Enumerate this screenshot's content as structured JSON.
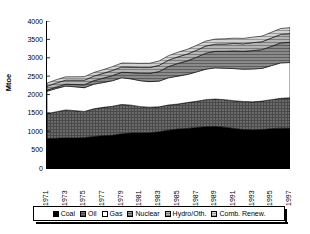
{
  "chart_data": {
    "type": "area",
    "stacked": true,
    "title": "",
    "xlabel": "",
    "ylabel": "Mtoe",
    "ylim": [
      0,
      4000
    ],
    "ytick_step": 500,
    "yticks": [
      4000,
      3500,
      3000,
      2500,
      2000,
      1500,
      1000,
      500,
      0
    ],
    "grid": false,
    "legend_position": "bottom",
    "x": [
      1971,
      1972,
      1973,
      1974,
      1975,
      1976,
      1977,
      1978,
      1979,
      1980,
      1981,
      1982,
      1983,
      1984,
      1985,
      1986,
      1987,
      1988,
      1989,
      1990,
      1991,
      1992,
      1993,
      1994,
      1995,
      1996,
      1997
    ],
    "xtick_labels": [
      "1971",
      "1972",
      "1973",
      "1974",
      "1975",
      "1976",
      "1977",
      "1978",
      "1979",
      "1980",
      "1981",
      "1982",
      "1983",
      "1984",
      "1985",
      "1986",
      "1987",
      "1988",
      "1989",
      "1990",
      "1991",
      "1992",
      "1993",
      "1994",
      "1995",
      "1996",
      "1997"
    ],
    "xtick_labels_shown": [
      "1971",
      "1973",
      "1975",
      "1977",
      "1979",
      "1981",
      "1983",
      "1985",
      "1987",
      "1989",
      "1991",
      "1993",
      "1995",
      "1997"
    ],
    "series": [
      {
        "name": "Coal",
        "color": "#000000",
        "values": [
          800,
          810,
          820,
          820,
          825,
          855,
          880,
          890,
          930,
          950,
          950,
          960,
          985,
          1030,
          1060,
          1075,
          1100,
          1125,
          1130,
          1110,
          1075,
          1045,
          1040,
          1045,
          1070,
          1085,
          1080
        ]
      },
      {
        "name": "Oil",
        "color": "#5a5a5a",
        "values": [
          680,
          720,
          760,
          740,
          715,
          755,
          770,
          790,
          800,
          760,
          720,
          695,
          680,
          685,
          680,
          705,
          715,
          735,
          745,
          750,
          755,
          765,
          760,
          775,
          790,
          810,
          830
        ]
      },
      {
        "name": "Gas",
        "color": "#ffffff",
        "values": [
          610,
          635,
          650,
          650,
          645,
          670,
          675,
          695,
          725,
          715,
          705,
          695,
          700,
          740,
          760,
          765,
          800,
          830,
          850,
          855,
          875,
          880,
          895,
          890,
          925,
          965,
          960
        ]
      },
      {
        "name": "Nuclear",
        "color": "#6e6e6e",
        "values": [
          30,
          40,
          50,
          60,
          80,
          95,
          120,
          140,
          150,
          170,
          205,
          225,
          260,
          305,
          345,
          370,
          400,
          435,
          450,
          460,
          480,
          485,
          500,
          510,
          525,
          545,
          550
        ]
      },
      {
        "name": "Hydro/Oth.",
        "color": "#9e9e9e",
        "values": [
          105,
          110,
          110,
          120,
          125,
          125,
          130,
          140,
          145,
          150,
          155,
          160,
          170,
          175,
          180,
          185,
          190,
          195,
          195,
          200,
          205,
          205,
          215,
          215,
          225,
          230,
          235
        ]
      },
      {
        "name": "Comb. Renew.",
        "color": "#c8c8c8",
        "values": [
          85,
          88,
          90,
          92,
          95,
          98,
          100,
          103,
          106,
          108,
          112,
          115,
          118,
          122,
          125,
          128,
          132,
          135,
          138,
          140,
          143,
          146,
          150,
          153,
          157,
          160,
          164
        ]
      }
    ]
  },
  "legend": {
    "items": [
      {
        "label": "Coal",
        "color": "#000000"
      },
      {
        "label": "Oil",
        "color": "#5a5a5a"
      },
      {
        "label": "Gas",
        "color": "#ffffff"
      },
      {
        "label": "Nuclear",
        "color": "#6e6e6e"
      },
      {
        "label": "Hydro/Oth.",
        "color": "#9e9e9e"
      },
      {
        "label": "Comb. Renew.",
        "color": "#c8c8c8"
      }
    ]
  },
  "axis": {
    "y_title": "Mtoe"
  },
  "title": {
    "text": ""
  }
}
